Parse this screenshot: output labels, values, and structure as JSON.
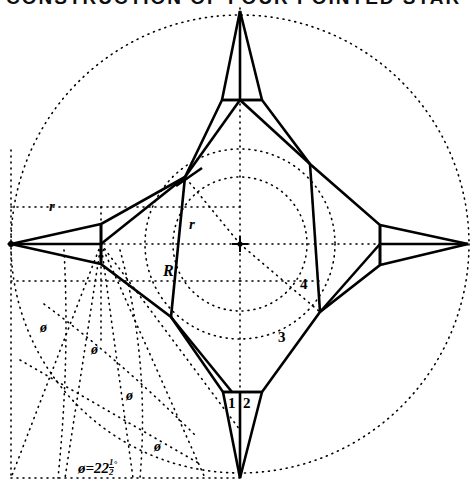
{
  "figure": {
    "title_fragment": "CONSTRUCTION OF FOUR POINTED STAR",
    "kind": "geometric-construction-drawing",
    "canvas": {
      "width": 476,
      "height": 491
    },
    "center": {
      "x": 240,
      "y": 244
    }
  },
  "labels": {
    "outer_radius_r": "r",
    "inner_radius_r": "r",
    "mid_radius_R": "R",
    "segment_1": "1",
    "segment_2": "2",
    "segment_3": "3",
    "segment_4": "4",
    "phi_1": "ø",
    "phi_2": "ø",
    "phi_3": "ø",
    "phi_4": "ø",
    "angle_equation_symbol": "ø",
    "angle_equation_equals": "=",
    "angle_equation_value": "22",
    "angle_equation_frac_num": "1",
    "angle_equation_frac_den": "2",
    "angle_equation_degree": "°"
  },
  "geometry": {
    "outer_circle": {
      "cx": 240,
      "cy": 244,
      "r": 229
    },
    "mid_circle": {
      "cx": 240,
      "cy": 244,
      "r": 95
    },
    "inner_circle": {
      "cx": 240,
      "cy": 244,
      "r": 67
    },
    "star_tips": [
      {
        "name": "top",
        "x": 240,
        "y": 11
      },
      {
        "name": "left",
        "x": 11,
        "y": 244
      },
      {
        "name": "bottom",
        "x": 240,
        "y": 478
      },
      {
        "name": "right",
        "x": 468,
        "y": 244
      }
    ],
    "body_vertices": [
      {
        "name": "upper-left",
        "x": 185,
        "y": 177
      },
      {
        "name": "upper-right",
        "x": 310,
        "y": 164
      },
      {
        "name": "lower-right",
        "x": 320,
        "y": 312
      },
      {
        "name": "lower-left",
        "x": 171,
        "y": 317
      }
    ],
    "fan_origin": {
      "x": 101,
      "y": 244
    },
    "fan_angle_deg": 22.5,
    "fan_ray_count": 5
  },
  "style": {
    "stroke": "#000000",
    "background": "#ffffff",
    "solid_width": 2.6,
    "dot_width": 1.6,
    "dash_pattern": "1,5"
  }
}
